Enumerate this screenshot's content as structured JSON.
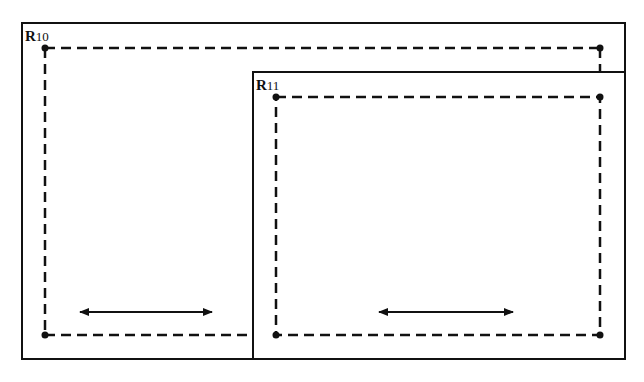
{
  "diagram": {
    "regions": [
      {
        "id": "R10",
        "label_main": "R",
        "label_sub": "10",
        "border": {
          "x": 22,
          "y": 23,
          "w": 603,
          "h": 336
        },
        "dashed_corners": [
          [
            45,
            48
          ],
          [
            600,
            48
          ],
          [
            45,
            335
          ]
        ],
        "arrow": {
          "x1": 78,
          "x2": 213,
          "y": 312,
          "direction": "bidirectional"
        }
      },
      {
        "id": "R11",
        "label_main": "R",
        "label_sub": "11",
        "border": {
          "x": 253,
          "y": 72,
          "w": 372,
          "h": 287
        },
        "dashed_corners": [
          [
            276,
            97
          ],
          [
            600,
            97
          ],
          [
            276,
            335
          ],
          [
            600,
            335
          ]
        ],
        "arrow": {
          "x1": 377,
          "x2": 514,
          "y": 312,
          "direction": "bidirectional"
        }
      }
    ],
    "colors": {
      "stroke": "#111111",
      "background": "#ffffff"
    }
  }
}
